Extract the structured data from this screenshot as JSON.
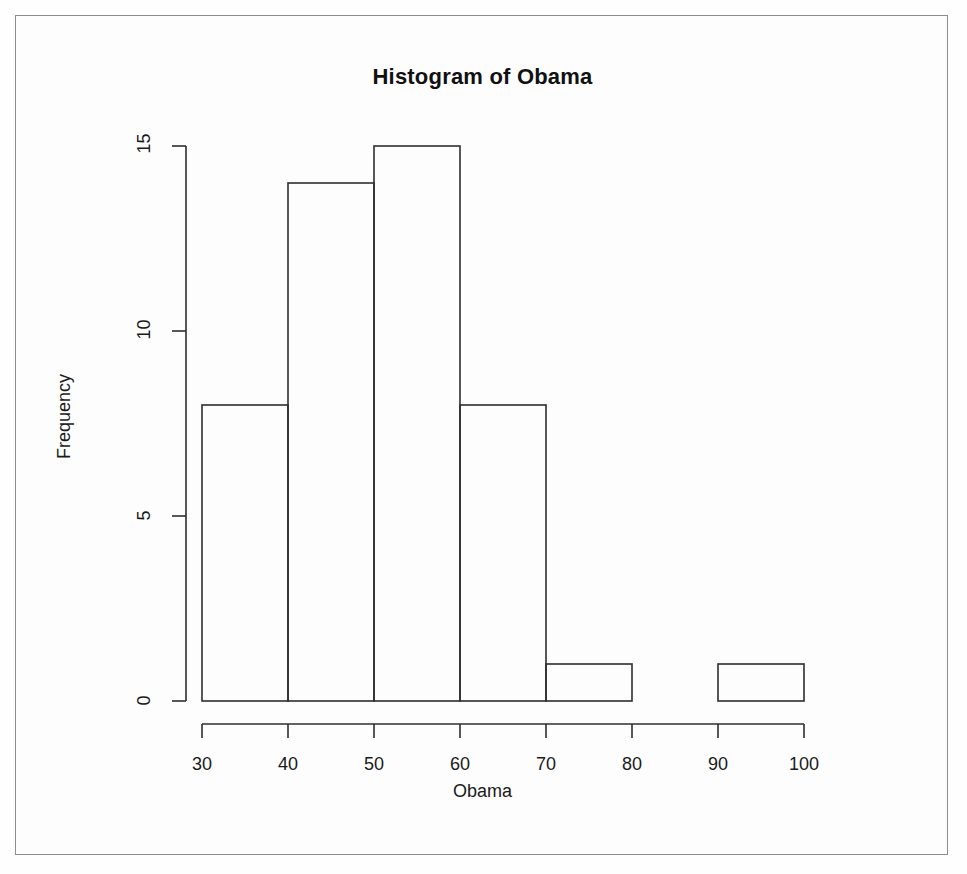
{
  "figure": {
    "title": "Histogram of Obama",
    "xlabel": "Obama",
    "ylabel": "Frequency"
  },
  "axes": {
    "x_ticks": [
      "30",
      "40",
      "50",
      "60",
      "70",
      "80",
      "90",
      "100"
    ],
    "y_ticks": [
      "0",
      "5",
      "10",
      "15"
    ]
  },
  "chart_data": {
    "type": "bar",
    "title": "Histogram of Obama",
    "xlabel": "Obama",
    "ylabel": "Frequency",
    "bin_edges": [
      30,
      40,
      50,
      60,
      70,
      80,
      90,
      100
    ],
    "categories": [
      "30-40",
      "40-50",
      "50-60",
      "60-70",
      "70-80",
      "80-90",
      "90-100"
    ],
    "values": [
      8,
      14,
      15,
      8,
      1,
      0,
      1
    ],
    "bin_width": 10,
    "xlim": [
      30,
      100
    ],
    "ylim": [
      0,
      15
    ],
    "xtick_values": [
      30,
      40,
      50,
      60,
      70,
      80,
      90,
      100
    ],
    "ytick_values": [
      0,
      5,
      10,
      15
    ],
    "grid": false,
    "legend": false,
    "bar_fill": "none",
    "bar_stroke": "#2e2e2e",
    "total_count": 47
  },
  "style": {
    "background": "#fdfdfd",
    "ink": "#2e2e2e",
    "frame": "#8d8d8d"
  }
}
